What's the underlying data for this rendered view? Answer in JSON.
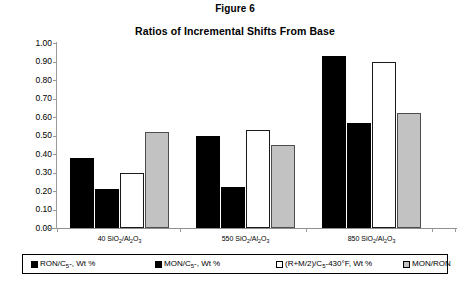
{
  "figure": {
    "caption": "Figure 6",
    "title": "Ratios of Incremental Shifts From Base"
  },
  "colors": {
    "series_black": "#000000",
    "series_white": "#ffffff",
    "series_gray": "#c2c2c2",
    "axis": "#9a9a9a",
    "text": "#000000",
    "background": "#ffffff"
  },
  "axis": {
    "y_ticks": [
      "0.00",
      "0.10",
      "0.20",
      "0.30",
      "0.40",
      "0.50",
      "0.60",
      "0.70",
      "0.80",
      "0.90",
      "1.00"
    ]
  },
  "legend": {
    "items": [
      {
        "swatch": "black",
        "label_main": "RON/C",
        "label_sub": "5",
        "label_tail": "-, Wt %"
      },
      {
        "swatch": "black",
        "label_main": "MON/C",
        "label_sub": "5",
        "label_tail": "-, Wt %"
      },
      {
        "swatch": "white",
        "label_main": "(R+M/2)/C",
        "label_sub": "5",
        "label_tail": "-430°F, Wt %"
      },
      {
        "swatch": "gray",
        "label_main": "MON/RON",
        "label_sub": "",
        "label_tail": ""
      }
    ]
  },
  "categories_parts": [
    {
      "prefix": "40 SiO",
      "sub1": "2",
      "mid": "/Al",
      "sub2": "2",
      "mid2": "O",
      "sub3": "3"
    },
    {
      "prefix": "550 SiO",
      "sub1": "2",
      "mid": "/Al",
      "sub2": "2",
      "mid2": "O",
      "sub3": "3"
    },
    {
      "prefix": "850 SiO",
      "sub1": "2",
      "mid": "/Al",
      "sub2": "2",
      "mid2": "O",
      "sub3": "3"
    }
  ],
  "chart_data": {
    "type": "bar",
    "title": "Ratios of Incremental Shifts From Base",
    "subtitle": "Figure 6",
    "xlabel": "",
    "ylabel": "",
    "ylim": [
      0.0,
      1.0
    ],
    "ytick_step": 0.1,
    "grid": false,
    "legend_position": "bottom",
    "categories": [
      "40 SiO2/Al2O3",
      "550 SiO2/Al2O3",
      "850 SiO2/Al2O3"
    ],
    "series": [
      {
        "name": "RON/C5-, Wt %",
        "color": "#000000",
        "values": [
          0.38,
          0.5,
          0.93
        ]
      },
      {
        "name": "MON/C5-, Wt %",
        "color": "#000000",
        "values": [
          0.21,
          0.22,
          0.57
        ]
      },
      {
        "name": "(R+M/2)/C5-430°F, Wt %",
        "color": "#ffffff",
        "values": [
          0.3,
          0.53,
          0.9
        ]
      },
      {
        "name": "MON/RON",
        "color": "#c2c2c2",
        "values": [
          0.52,
          0.45,
          0.62
        ]
      }
    ]
  }
}
